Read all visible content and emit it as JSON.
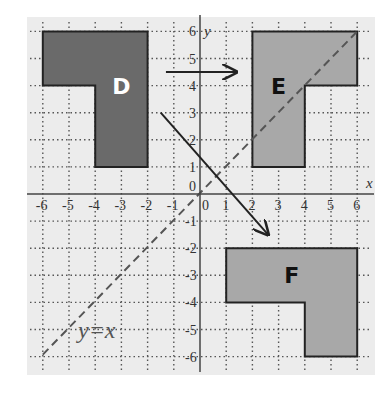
{
  "diagram": {
    "type": "coordinate-plane-transformations",
    "axes": {
      "x_label": "x",
      "y_label": "y",
      "x_range": [
        -6,
        6
      ],
      "y_range": [
        -6,
        6
      ],
      "x_ticks": [
        "-6",
        "-5",
        "-4",
        "-3",
        "-2",
        "-1",
        "0",
        "1",
        "2",
        "3",
        "4",
        "5",
        "6"
      ],
      "y_ticks": [
        "6",
        "5",
        "4",
        "3",
        "2",
        "1",
        "0",
        "-1",
        "-2",
        "-3",
        "-4",
        "-5",
        "-6"
      ],
      "grid": "dotted"
    },
    "line": {
      "label": "y=x",
      "style": "dashed",
      "from": [
        -6,
        -6
      ],
      "to": [
        6,
        6
      ]
    },
    "shapes": [
      {
        "label": "D",
        "fill": "#6a6a6a",
        "label_color": "#ffffff",
        "vertices": [
          [
            -6,
            6
          ],
          [
            -2,
            6
          ],
          [
            -2,
            1
          ],
          [
            -4,
            1
          ],
          [
            -4,
            4
          ],
          [
            -6,
            4
          ]
        ]
      },
      {
        "label": "E",
        "fill": "#a8a8a8",
        "label_color": "#111111",
        "vertices": [
          [
            2,
            6
          ],
          [
            6,
            6
          ],
          [
            6,
            4
          ],
          [
            4,
            4
          ],
          [
            4,
            1
          ],
          [
            2,
            1
          ]
        ]
      },
      {
        "label": "F",
        "fill": "#a8a8a8",
        "label_color": "#111111",
        "vertices": [
          [
            1,
            -2
          ],
          [
            6,
            -2
          ],
          [
            6,
            -6
          ],
          [
            4,
            -6
          ],
          [
            4,
            -4
          ],
          [
            1,
            -4
          ]
        ]
      }
    ],
    "arrows": [
      {
        "name": "D-to-E",
        "from": [
          -1.3,
          4.5
        ],
        "to": [
          1.4,
          4.5
        ]
      },
      {
        "name": "D-to-F",
        "from": [
          -1.5,
          3
        ],
        "to": [
          2.6,
          -1.5
        ]
      }
    ],
    "colors": {
      "panel": "#ececec",
      "grid": "#555555",
      "axis": "#444444",
      "outline": "#222222"
    }
  }
}
